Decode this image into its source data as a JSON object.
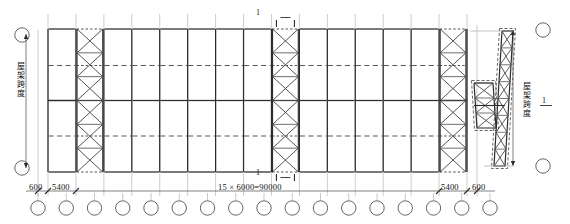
{
  "drawing": {
    "title": "roof-truss-bracing-plan",
    "colors": {
      "line": "#4a4a4a",
      "heavy": "#2b2b2b",
      "thin": "#9a9a9a",
      "dash": "#555555",
      "text": "#111111",
      "background": "#ffffff"
    },
    "plan": {
      "bays_total": 15,
      "truss_lines": 16,
      "braced_bays": [
        1,
        8,
        14
      ],
      "purlin_rows": 5,
      "brace_cells_per_panel": 6
    },
    "dimensions": {
      "left_end": "600",
      "left_bay": "5400",
      "center": "15 × 6000=90000",
      "right_bay": "5400",
      "right_end": "600"
    },
    "labels": {
      "span_vertical": "屋架跨度",
      "section_vertical": "屋架跨度",
      "section_top": "1",
      "section_bottom": "1",
      "section_side": "1"
    },
    "grid_markers": {
      "bottom_count": 17,
      "left_count": 2,
      "right_count": 2
    }
  }
}
